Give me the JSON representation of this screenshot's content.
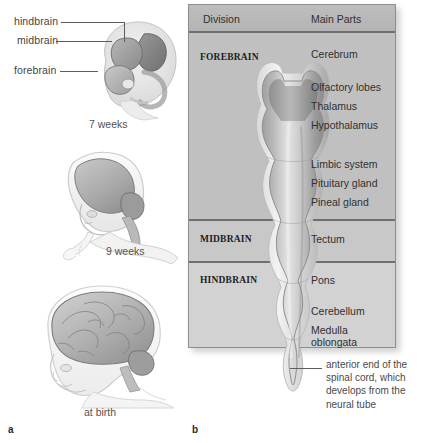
{
  "figure": {
    "panel_a": {
      "letter": "a",
      "callouts": [
        {
          "label": "hindbrain"
        },
        {
          "label": "midbrain"
        },
        {
          "label": "forebrain"
        }
      ],
      "stages": [
        {
          "caption": "7 weeks"
        },
        {
          "caption": "9 weeks"
        },
        {
          "caption": "at birth"
        }
      ]
    },
    "panel_b": {
      "letter": "b",
      "table": {
        "headers": {
          "division": "Division",
          "main_parts": "Main Parts"
        },
        "rows": [
          {
            "division": "FOREBRAIN",
            "parts": [
              "Cerebrum",
              "Olfactory lobes",
              "Thalamus",
              "Hypothalamus",
              "Limbic system",
              "Pituitary gland",
              "Pineal gland"
            ]
          },
          {
            "division": "MIDBRAIN",
            "parts": [
              "Tectum"
            ]
          },
          {
            "division": "HINDBRAIN",
            "parts": [
              "Pons",
              "Cerebellum",
              "Medulla",
              "oblongata"
            ]
          }
        ]
      },
      "caption": "anterior end of the spinal cord, which develops from the neural tube"
    }
  },
  "colors": {
    "table_background": "#c3c3c3",
    "header_background": "#b8b8b8",
    "rule": "#6f6f6f",
    "text": "#303030",
    "label_text": "#444444"
  }
}
